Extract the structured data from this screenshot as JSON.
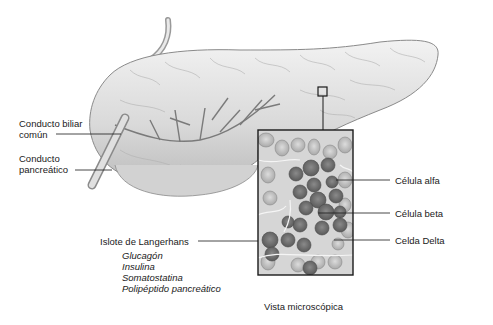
{
  "diagram": {
    "title_area": "Páncreas y vista microscópica de un islote de Langerhans",
    "labels": {
      "bile_duct": "Conducto biliar común",
      "bile_duct_line1": "Conducto biliar",
      "bile_duct_line2": "común",
      "pancreatic_duct_line1": "Conducto",
      "pancreatic_duct_line2": "pancreático",
      "islet": "Islote de Langerhans",
      "alpha_cell": "Célula alfa",
      "beta_cell": "Célula beta",
      "delta_cell": "Celda Delta",
      "microscopic_view": "Vista microscópica"
    },
    "hormones": [
      "Glucagón",
      "Insulina",
      "Somatostatina",
      "Polipéptido pancreático"
    ],
    "colors": {
      "organ_fill": "#e6e6e6",
      "organ_stroke": "#8a8a8a",
      "inset_border": "#1a1a1a",
      "cell_dark": "#6e6e6e",
      "cell_light": "#c8c8c8",
      "leader_line": "#1a1a1a"
    }
  }
}
